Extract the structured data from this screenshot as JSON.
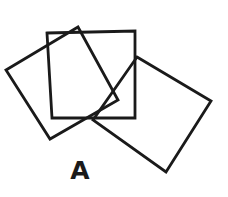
{
  "figure": {
    "label": "A",
    "label_position": {
      "x": 80,
      "y": 171
    },
    "background_color": "#ffffff",
    "stroke_color": "#1a1a1a",
    "stroke_width": 2.8,
    "canvas": {
      "width": 228,
      "height": 197
    },
    "shape_count": 3,
    "shapes": [
      {
        "name": "square-left-tilted",
        "kind": "square-outline",
        "rotation_deg": -28,
        "side_length": 80,
        "center": {
          "x": 62,
          "y": 83
        },
        "points": "78,27 118,100 50,139 6,70"
      },
      {
        "name": "square-center-upright",
        "kind": "square-outline",
        "rotation_deg": 1,
        "side_length": 87,
        "center": {
          "x": 91,
          "y": 75
        },
        "points": "47,33 135,31 135,118 52,118"
      },
      {
        "name": "square-right-tilted",
        "kind": "square-outline",
        "rotation_deg": 31,
        "side_length": 86,
        "center": {
          "x": 152,
          "y": 114
        },
        "points": "137,57 211,101 166,172 93,120"
      }
    ]
  }
}
